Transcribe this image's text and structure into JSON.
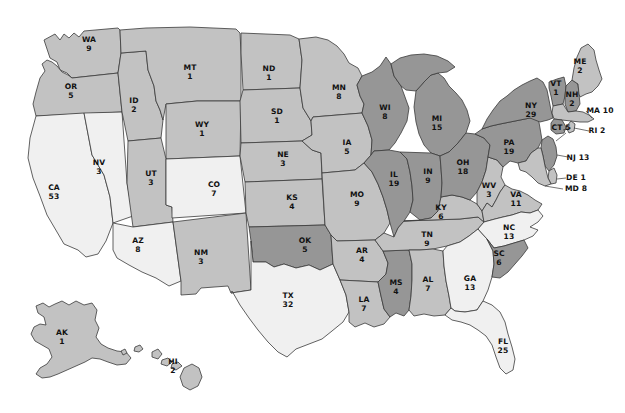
{
  "map": {
    "title": "United States Electoral College Votes by State",
    "projection": "albers-usa",
    "background_color": "#ffffff",
    "border_color": "#3a3a3a",
    "legend_tiers": [
      {
        "name": "dark",
        "color": "#969696"
      },
      {
        "name": "medium",
        "color": "#c2c2c2"
      },
      {
        "name": "light",
        "color": "#f0f0f0"
      }
    ],
    "states": [
      {
        "code": "WA",
        "value": "9",
        "tier": "medium",
        "lx": 89,
        "ly": 45,
        "style": "stacked"
      },
      {
        "code": "OR",
        "value": "5",
        "tier": "medium",
        "lx": 71,
        "ly": 92,
        "style": "stacked"
      },
      {
        "code": "CA",
        "value": "53",
        "tier": "light",
        "lx": 54,
        "ly": 193,
        "style": "stacked"
      },
      {
        "code": "NV",
        "value": "3",
        "tier": "light",
        "lx": 99,
        "ly": 168,
        "style": "stacked"
      },
      {
        "code": "ID",
        "value": "2",
        "tier": "medium",
        "lx": 134,
        "ly": 106,
        "style": "stacked"
      },
      {
        "code": "MT",
        "value": "1",
        "tier": "medium",
        "lx": 190,
        "ly": 73,
        "style": "stacked"
      },
      {
        "code": "WY",
        "value": "1",
        "tier": "medium",
        "lx": 202,
        "ly": 130,
        "style": "stacked"
      },
      {
        "code": "UT",
        "value": "3",
        "tier": "medium",
        "lx": 151,
        "ly": 179,
        "style": "stacked"
      },
      {
        "code": "CO",
        "value": "7",
        "tier": "light",
        "lx": 214,
        "ly": 190,
        "style": "stacked"
      },
      {
        "code": "AZ",
        "value": "8",
        "tier": "light",
        "lx": 138,
        "ly": 246,
        "style": "stacked"
      },
      {
        "code": "NM",
        "value": "3",
        "tier": "medium",
        "lx": 201,
        "ly": 258,
        "style": "stacked"
      },
      {
        "code": "ND",
        "value": "1",
        "tier": "medium",
        "lx": 269,
        "ly": 74,
        "style": "stacked"
      },
      {
        "code": "SD",
        "value": "1",
        "tier": "medium",
        "lx": 277,
        "ly": 117,
        "style": "stacked"
      },
      {
        "code": "NE",
        "value": "3",
        "tier": "medium",
        "lx": 283,
        "ly": 160,
        "style": "stacked"
      },
      {
        "code": "KS",
        "value": "4",
        "tier": "medium",
        "lx": 292,
        "ly": 203,
        "style": "stacked"
      },
      {
        "code": "OK",
        "value": "5",
        "tier": "dark",
        "lx": 305,
        "ly": 246,
        "style": "stacked"
      },
      {
        "code": "TX",
        "value": "32",
        "tier": "light",
        "lx": 288,
        "ly": 301,
        "style": "stacked"
      },
      {
        "code": "MN",
        "value": "8",
        "tier": "medium",
        "lx": 339,
        "ly": 93,
        "style": "stacked"
      },
      {
        "code": "IA",
        "value": "5",
        "tier": "medium",
        "lx": 347,
        "ly": 148,
        "style": "stacked"
      },
      {
        "code": "MO",
        "value": "9",
        "tier": "medium",
        "lx": 357,
        "ly": 200,
        "style": "stacked"
      },
      {
        "code": "AR",
        "value": "4",
        "tier": "medium",
        "lx": 362,
        "ly": 256,
        "style": "stacked"
      },
      {
        "code": "LA",
        "value": "7",
        "tier": "medium",
        "lx": 364,
        "ly": 305,
        "style": "stacked"
      },
      {
        "code": "WI",
        "value": "8",
        "tier": "dark",
        "lx": 385,
        "ly": 113,
        "style": "stacked"
      },
      {
        "code": "IL",
        "value": "19",
        "tier": "dark",
        "lx": 394,
        "ly": 180,
        "style": "stacked"
      },
      {
        "code": "MS",
        "value": "4",
        "tier": "dark",
        "lx": 396,
        "ly": 288,
        "style": "stacked"
      },
      {
        "code": "MI",
        "value": "15",
        "tier": "dark",
        "lx": 437,
        "ly": 124,
        "style": "stacked"
      },
      {
        "code": "IN",
        "value": "9",
        "tier": "dark",
        "lx": 428,
        "ly": 177,
        "style": "stacked"
      },
      {
        "code": "TN",
        "value": "9",
        "tier": "medium",
        "lx": 427,
        "ly": 240,
        "style": "stacked"
      },
      {
        "code": "AL",
        "value": "7",
        "tier": "medium",
        "lx": 428,
        "ly": 285,
        "style": "stacked"
      },
      {
        "code": "KY",
        "value": "6",
        "tier": "medium",
        "lx": 441,
        "ly": 213,
        "style": "stacked"
      },
      {
        "code": "OH",
        "value": "18",
        "tier": "dark",
        "lx": 463,
        "ly": 168,
        "style": "stacked"
      },
      {
        "code": "GA",
        "value": "13",
        "tier": "light",
        "lx": 470,
        "ly": 284,
        "style": "stacked"
      },
      {
        "code": "FL",
        "value": "25",
        "tier": "light",
        "lx": 503,
        "ly": 347,
        "style": "stacked"
      },
      {
        "code": "WV",
        "value": "3",
        "tier": "medium",
        "lx": 489,
        "ly": 191,
        "style": "stacked"
      },
      {
        "code": "VA",
        "value": "11",
        "tier": "medium",
        "lx": 516,
        "ly": 200,
        "style": "stacked"
      },
      {
        "code": "NC",
        "value": "13",
        "tier": "light",
        "lx": 509,
        "ly": 233,
        "style": "stacked"
      },
      {
        "code": "SC",
        "value": "6",
        "tier": "dark",
        "lx": 499,
        "ly": 259,
        "style": "stacked"
      },
      {
        "code": "PA",
        "value": "19",
        "tier": "dark",
        "lx": 509,
        "ly": 148,
        "style": "stacked"
      },
      {
        "code": "NY",
        "value": "29",
        "tier": "dark",
        "lx": 531,
        "ly": 111,
        "style": "stacked"
      },
      {
        "code": "VT",
        "value": "1",
        "tier": "dark",
        "lx": 556,
        "ly": 89,
        "style": "stacked"
      },
      {
        "code": "NH",
        "value": "2",
        "tier": "dark",
        "lx": 572,
        "ly": 100,
        "style": "stacked"
      },
      {
        "code": "ME",
        "value": "2",
        "tier": "medium",
        "lx": 580,
        "ly": 67,
        "style": "stacked"
      },
      {
        "code": "MA",
        "value": "10",
        "tier": "medium",
        "lx": 600,
        "ly": 111,
        "style": "inline"
      },
      {
        "code": "CT",
        "value": "5",
        "tier": "dark",
        "lx": 561,
        "ly": 128,
        "style": "inline"
      },
      {
        "code": "RI",
        "value": "2",
        "tier": "medium",
        "lx": 597,
        "ly": 131,
        "style": "inline"
      },
      {
        "code": "NJ",
        "value": "13",
        "tier": "dark",
        "lx": 578,
        "ly": 158,
        "style": "inline"
      },
      {
        "code": "DE",
        "value": "1",
        "tier": "medium",
        "lx": 576,
        "ly": 178,
        "style": "inline"
      },
      {
        "code": "MD",
        "value": "8",
        "tier": "medium",
        "lx": 576,
        "ly": 189,
        "style": "inline"
      },
      {
        "code": "AK",
        "value": "1",
        "tier": "medium",
        "lx": 62,
        "ly": 338,
        "style": "stacked"
      },
      {
        "code": "HI",
        "value": "2",
        "tier": "medium",
        "lx": 173,
        "ly": 367,
        "style": "stacked"
      }
    ]
  }
}
